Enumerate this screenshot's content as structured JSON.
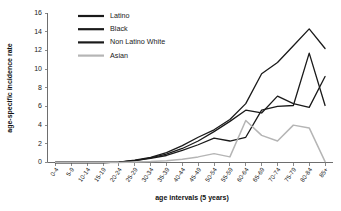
{
  "chart_data": {
    "type": "line",
    "title": "",
    "xlabel": "age intervals (5 years)",
    "ylabel": "age-specific incidence rate",
    "categories": [
      "0-4",
      "5-9",
      "10-14",
      "15-19",
      "20-24",
      "25-29",
      "30-34",
      "35-39",
      "40-44",
      "45-49",
      "50-54",
      "55-59",
      "60-64",
      "65-69",
      "70-74",
      "75-79",
      "80-84",
      "85+"
    ],
    "ylim": [
      0,
      16
    ],
    "yticks": [
      0,
      2,
      4,
      6,
      8,
      10,
      12,
      14,
      16
    ],
    "grid": false,
    "legend_position": "top-left",
    "series": [
      {
        "name": "Latino",
        "color": "#1a1a1a",
        "values": [
          0,
          0,
          0,
          0,
          0.05,
          0.25,
          0.55,
          1.05,
          1.8,
          2.7,
          3.5,
          4.6,
          6.3,
          9.5,
          10.7,
          12.5,
          14.3,
          12.2
        ]
      },
      {
        "name": "Black",
        "color": "#1a1a1a",
        "values": [
          0,
          0,
          0,
          0,
          0.05,
          0.2,
          0.45,
          0.75,
          1.3,
          1.9,
          2.6,
          2.3,
          2.7,
          5.6,
          6.0,
          6.1,
          11.7,
          6.1
        ]
      },
      {
        "name": "Non Latino White",
        "color": "#1a1a1a",
        "values": [
          0,
          0,
          0,
          0,
          0.05,
          0.2,
          0.5,
          0.9,
          1.5,
          2.3,
          3.3,
          4.4,
          5.6,
          5.3,
          7.1,
          6.3,
          5.9,
          9.2
        ]
      },
      {
        "name": "Asian",
        "color": "#b5b5b5",
        "values": [
          0,
          0,
          0,
          0,
          0,
          0.05,
          0.1,
          0.2,
          0.35,
          0.6,
          0.95,
          0.6,
          4.5,
          2.9,
          2.3,
          4.0,
          3.7,
          0.1
        ]
      }
    ]
  },
  "legend": {
    "items": [
      {
        "label": "Latino"
      },
      {
        "label": "Black"
      },
      {
        "label": "Non Latino White"
      },
      {
        "label": "Asian"
      }
    ]
  },
  "axes": {
    "y_title": "age-specific incidence rate",
    "x_title": "age intervals (5 years)"
  }
}
